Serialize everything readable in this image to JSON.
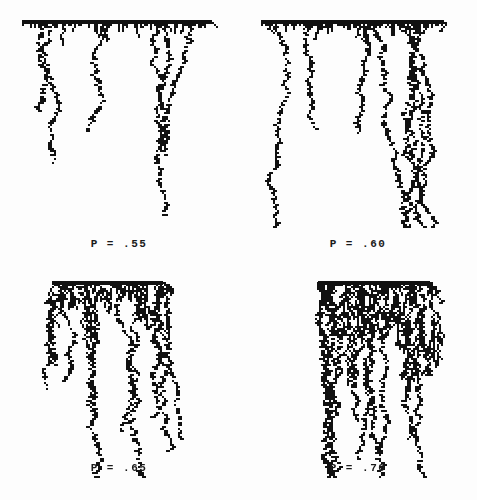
{
  "figure": {
    "background_color": "#fdfdfd",
    "ink_color": "#111111",
    "columns": 2,
    "rows": 2
  },
  "chart_data": {
    "type": "scatter",
    "xlabel": "",
    "ylabel": "",
    "grid": false,
    "legend": null,
    "panels": [
      {
        "id": "panel-1",
        "label": "P = .55",
        "p": 0.55,
        "grid_position": [
          0,
          0
        ],
        "seed_line": {
          "x_start": 22,
          "x_end": 212,
          "y": 22,
          "thickness": 4
        },
        "lattice_cell_px": 2,
        "cluster_extent": {
          "x_min": 22,
          "x_max": 214,
          "y_min": 20,
          "y_max": 168
        },
        "max_depth_px": 146,
        "fill_density": 0.1,
        "tendril_count": 6,
        "spanning": false
      },
      {
        "id": "panel-2",
        "label": "P = .60",
        "p": 0.6,
        "grid_position": [
          0,
          1
        ],
        "seed_line": {
          "x_start": 22,
          "x_end": 205,
          "y": 22,
          "thickness": 4
        },
        "lattice_cell_px": 2,
        "cluster_extent": {
          "x_min": 18,
          "x_max": 215,
          "y_min": 20,
          "y_max": 232
        },
        "max_depth_px": 210,
        "fill_density": 0.18,
        "tendril_count": 8,
        "spanning": false
      },
      {
        "id": "panel-3",
        "label": "P = .65",
        "p": 0.65,
        "grid_position": [
          1,
          0
        ],
        "seed_line": {
          "x_start": 52,
          "x_end": 163,
          "y": 33,
          "thickness": 4
        },
        "lattice_cell_px": 2,
        "cluster_extent": {
          "x_min": 26,
          "x_max": 200,
          "y_min": 31,
          "y_max": 205
        },
        "max_depth_px": 172,
        "fill_density": 0.42,
        "tendril_count": 10,
        "spanning": true
      },
      {
        "id": "panel-4",
        "label": "P = .70",
        "p": 0.7,
        "grid_position": [
          1,
          1
        ],
        "seed_line": {
          "x_start": 79,
          "x_end": 191,
          "y": 33,
          "thickness": 4
        },
        "lattice_cell_px": 2,
        "cluster_extent": {
          "x_min": 40,
          "x_max": 218,
          "y_min": 31,
          "y_max": 205
        },
        "max_depth_px": 172,
        "fill_density": 0.66,
        "tendril_count": 12,
        "spanning": true
      }
    ]
  }
}
